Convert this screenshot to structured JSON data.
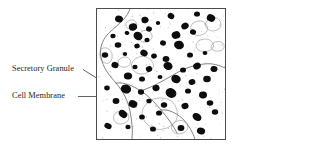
{
  "figure": {
    "type": "labeled-micrograph-diagram",
    "width": 238,
    "height": 150,
    "background_color": "#ffffff"
  },
  "labels": [
    {
      "id": "secretory-granule",
      "text": "Secretory Granule",
      "color": "#231f20",
      "leader": {
        "from_x": 83,
        "from_y": 69.5,
        "to_x": 124.5,
        "to_y": 95.5
      }
    },
    {
      "id": "cell-membrane",
      "text": "Cell Membrane",
      "color": "#231f20",
      "leader": {
        "from_x": 78,
        "from_y": 96.5,
        "to_x": 126,
        "to_y": 96.5
      }
    }
  ],
  "panel": {
    "name": "electron-micrograph",
    "border_color": "#4c4c50",
    "background_color": "#ffffff",
    "x": 96,
    "y": 8,
    "width": 130,
    "height": 132
  },
  "micrograph": {
    "granule_color": "#0d0d0d",
    "membrane_color": "#77777a",
    "vesicle_outline_color": "#a3a3a6",
    "speckle_color": "#c9c9cc",
    "granule_count": 62,
    "granules": [
      {
        "cx": 22,
        "cy": 10,
        "rx": 4.0,
        "ry": 3.4,
        "rot": 18
      },
      {
        "cx": 48,
        "cy": 11,
        "rx": 3.6,
        "ry": 3.2,
        "rot": -12
      },
      {
        "cx": 74,
        "cy": 7,
        "rx": 3.4,
        "ry": 3.0,
        "rot": 30
      },
      {
        "cx": 100,
        "cy": 5,
        "rx": 3.0,
        "ry": 2.6,
        "rot": 0
      },
      {
        "cx": 114,
        "cy": 9,
        "rx": 4.3,
        "ry": 3.6,
        "rot": 25
      },
      {
        "cx": 36,
        "cy": 18,
        "rx": 4.2,
        "ry": 3.6,
        "rot": -20
      },
      {
        "cx": 52,
        "cy": 20,
        "rx": 3.0,
        "ry": 2.6,
        "rot": 10
      },
      {
        "cx": 61,
        "cy": 14,
        "rx": 2.2,
        "ry": 1.9,
        "rot": 0
      },
      {
        "cx": 88,
        "cy": 17,
        "rx": 3.8,
        "ry": 3.3,
        "rot": -30
      },
      {
        "cx": 16,
        "cy": 27,
        "rx": 2.6,
        "ry": 2.3,
        "rot": 0
      },
      {
        "cx": 30,
        "cy": 24,
        "rx": 2.4,
        "ry": 2.0,
        "rot": 14
      },
      {
        "cx": 41,
        "cy": 27,
        "rx": 4.7,
        "ry": 4.0,
        "rot": 35
      },
      {
        "cx": 50,
        "cy": 31,
        "rx": 2.6,
        "ry": 2.2,
        "rot": 0
      },
      {
        "cx": 79,
        "cy": 26,
        "rx": 4.4,
        "ry": 3.8,
        "rot": -18
      },
      {
        "cx": 96,
        "cy": 23,
        "rx": 3.1,
        "ry": 2.7,
        "rot": 22
      },
      {
        "cx": 21,
        "cy": 36,
        "rx": 3.3,
        "ry": 2.8,
        "rot": 0
      },
      {
        "cx": 40,
        "cy": 37,
        "rx": 2.8,
        "ry": 2.4,
        "rot": -10
      },
      {
        "cx": 66,
        "cy": 34,
        "rx": 3.0,
        "ry": 2.6,
        "rot": 8
      },
      {
        "cx": 82,
        "cy": 36,
        "rx": 5.0,
        "ry": 4.3,
        "rot": 15
      },
      {
        "cx": 8,
        "cy": 46,
        "rx": 3.2,
        "ry": 2.8,
        "rot": 0
      },
      {
        "cx": 28,
        "cy": 45,
        "rx": 2.2,
        "ry": 1.9,
        "rot": 0
      },
      {
        "cx": 47,
        "cy": 44,
        "rx": 3.8,
        "ry": 3.2,
        "rot": 28
      },
      {
        "cx": 57,
        "cy": 47,
        "rx": 2.9,
        "ry": 2.5,
        "rot": -14
      },
      {
        "cx": 69,
        "cy": 50,
        "rx": 3.4,
        "ry": 2.9,
        "rot": 0
      },
      {
        "cx": 93,
        "cy": 46,
        "rx": 3.0,
        "ry": 2.6,
        "rot": 0
      },
      {
        "cx": 108,
        "cy": 44,
        "rx": 2.4,
        "ry": 2.1,
        "rot": 0
      },
      {
        "cx": 18,
        "cy": 56,
        "rx": 3.6,
        "ry": 3.1,
        "rot": 10
      },
      {
        "cx": 38,
        "cy": 58,
        "rx": 2.6,
        "ry": 2.2,
        "rot": 0
      },
      {
        "cx": 52,
        "cy": 60,
        "rx": 3.2,
        "ry": 2.8,
        "rot": -20
      },
      {
        "cx": 71,
        "cy": 57,
        "rx": 4.6,
        "ry": 3.9,
        "rot": 18
      },
      {
        "cx": 86,
        "cy": 61,
        "rx": 3.0,
        "ry": 2.6,
        "rot": 0
      },
      {
        "cx": 100,
        "cy": 57,
        "rx": 3.9,
        "ry": 3.3,
        "rot": -25
      },
      {
        "cx": 117,
        "cy": 60,
        "rx": 3.5,
        "ry": 3.0,
        "rot": 12
      },
      {
        "cx": 31,
        "cy": 67,
        "rx": 4.1,
        "ry": 3.5,
        "rot": 0
      },
      {
        "cx": 45,
        "cy": 70,
        "rx": 3.0,
        "ry": 2.6,
        "rot": 0
      },
      {
        "cx": 63,
        "cy": 68,
        "rx": 2.5,
        "ry": 2.1,
        "rot": 0
      },
      {
        "cx": 79,
        "cy": 70,
        "rx": 4.8,
        "ry": 4.1,
        "rot": 22
      },
      {
        "cx": 95,
        "cy": 73,
        "rx": 3.4,
        "ry": 2.9,
        "rot": -16
      },
      {
        "cx": 110,
        "cy": 70,
        "rx": 3.8,
        "ry": 3.2,
        "rot": 0
      },
      {
        "cx": 10,
        "cy": 79,
        "rx": 2.8,
        "ry": 2.4,
        "rot": 0
      },
      {
        "cx": 29,
        "cy": 80,
        "rx": 5.2,
        "ry": 4.4,
        "rot": 14
      },
      {
        "cx": 44,
        "cy": 83,
        "rx": 3.1,
        "ry": 2.7,
        "rot": 0
      },
      {
        "cx": 59,
        "cy": 79,
        "rx": 3.6,
        "ry": 3.1,
        "rot": -18
      },
      {
        "cx": 74,
        "cy": 84,
        "rx": 5.6,
        "ry": 4.7,
        "rot": 30
      },
      {
        "cx": 91,
        "cy": 82,
        "rx": 3.0,
        "ry": 2.6,
        "rot": 0
      },
      {
        "cx": 106,
        "cy": 86,
        "rx": 4.0,
        "ry": 3.4,
        "rot": 0
      },
      {
        "cx": 19,
        "cy": 92,
        "rx": 3.4,
        "ry": 2.9,
        "rot": 0
      },
      {
        "cx": 36,
        "cy": 95,
        "rx": 4.4,
        "ry": 3.7,
        "rot": 20
      },
      {
        "cx": 52,
        "cy": 92,
        "rx": 2.7,
        "ry": 2.3,
        "rot": 0
      },
      {
        "cx": 67,
        "cy": 96,
        "rx": 3.2,
        "ry": 2.8,
        "rot": 0
      },
      {
        "cx": 88,
        "cy": 97,
        "rx": 3.6,
        "ry": 3.1,
        "rot": -12
      },
      {
        "cx": 113,
        "cy": 94,
        "rx": 3.3,
        "ry": 2.8,
        "rot": 0
      },
      {
        "cx": 26,
        "cy": 105,
        "rx": 4.6,
        "ry": 3.4,
        "rot": 38
      },
      {
        "cx": 45,
        "cy": 108,
        "rx": 2.9,
        "ry": 2.5,
        "rot": 0
      },
      {
        "cx": 62,
        "cy": 104,
        "rx": 3.0,
        "ry": 2.6,
        "rot": 0
      },
      {
        "cx": 100,
        "cy": 108,
        "rx": 4.8,
        "ry": 3.6,
        "rot": 35
      },
      {
        "cx": 118,
        "cy": 103,
        "rx": 3.2,
        "ry": 2.7,
        "rot": 0
      },
      {
        "cx": 11,
        "cy": 117,
        "rx": 3.8,
        "ry": 2.8,
        "rot": 25
      },
      {
        "cx": 31,
        "cy": 118,
        "rx": 2.6,
        "ry": 2.2,
        "rot": 0
      },
      {
        "cx": 56,
        "cy": 120,
        "rx": 3.0,
        "ry": 2.6,
        "rot": 0
      },
      {
        "cx": 84,
        "cy": 119,
        "rx": 3.4,
        "ry": 2.9,
        "rot": 0
      },
      {
        "cx": 104,
        "cy": 122,
        "rx": 4.2,
        "ry": 3.4,
        "rot": 18
      }
    ]
  }
}
